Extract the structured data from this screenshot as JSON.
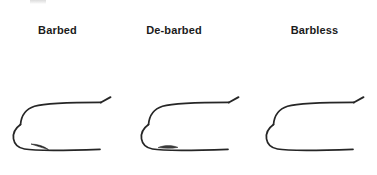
{
  "figure": {
    "background_color": "#ffffff",
    "hook_line_color": "#262626",
    "label_color": "#1b1b1b"
  },
  "hooks": [
    {
      "label": "Barbed",
      "point_type": "barbed",
      "description": "Hook with a full sharp rearward-facing barb behind the point"
    },
    {
      "label": "De-barbed",
      "point_type": "de-barbed",
      "description": "Hook with the barb crushed flat leaving a small stub"
    },
    {
      "label": "Barbless",
      "point_type": "barbless",
      "description": "Hook with a clean tapered point and no barb"
    }
  ]
}
